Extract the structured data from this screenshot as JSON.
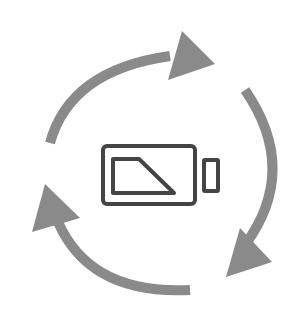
{
  "icon": {
    "title": "battery-recycle-icon",
    "description": "Battery with three circular arrows indicating recycling / recharging cycle",
    "colors": {
      "background": "#ffffff",
      "arrows": "#8a8a8a",
      "battery_stroke": "#444444"
    }
  }
}
